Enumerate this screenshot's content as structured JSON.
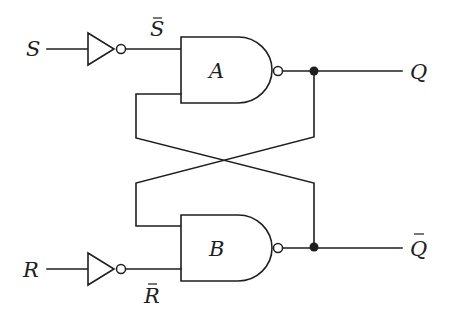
{
  "diagram": {
    "inputs": [
      {
        "id": "S",
        "label": "S",
        "inverted_label": "S",
        "inverted": true
      },
      {
        "id": "R",
        "label": "R",
        "inverted_label": "R",
        "inverted": true
      }
    ],
    "gates": [
      {
        "id": "A",
        "label": "A",
        "type": "NAND"
      },
      {
        "id": "B",
        "label": "B",
        "type": "NAND"
      }
    ],
    "outputs": [
      {
        "id": "Q",
        "label": "Q",
        "overbar": false
      },
      {
        "id": "Qbar",
        "label": "Q",
        "overbar": true
      }
    ],
    "connections": [
      "S -> NOT -> S̄ -> A.in1",
      "R -> NOT -> R̄ -> B.in2",
      "A.out -> Q",
      "B.out -> Q̄",
      "A.out -> B.in1 (cross-coupled)",
      "B.out -> A.in2 (cross-coupled)"
    ],
    "colors": {
      "line": "#1e1e1e",
      "background": "#ffffff"
    }
  }
}
